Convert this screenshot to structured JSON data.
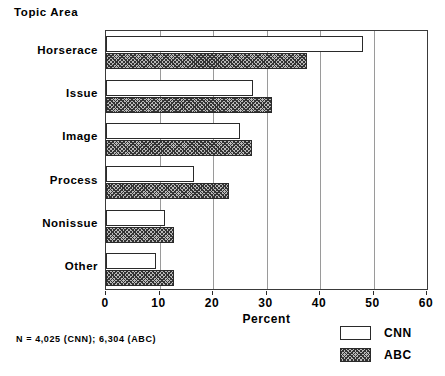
{
  "chart_data": {
    "type": "bar",
    "orientation": "horizontal",
    "title": "Topic Area",
    "xlabel": "Percent",
    "ylabel": "",
    "xlim": [
      0,
      60
    ],
    "xticks": [
      0,
      10,
      20,
      30,
      40,
      50,
      60
    ],
    "xtick_labels": [
      "0",
      "10",
      "20",
      "30",
      "40",
      "50",
      "60"
    ],
    "grid": true,
    "grid_axis": "x",
    "legend_position": "bottom-right",
    "categories": [
      "Horserace",
      "Issue",
      "Image",
      "Process",
      "Nonissue",
      "Other"
    ],
    "series": [
      {
        "name": "CNN",
        "color": "#ffffff",
        "pattern": "solid-white",
        "values": [
          48,
          27.5,
          25,
          16.5,
          11,
          9.3
        ]
      },
      {
        "name": "ABC",
        "color": "#b9b9b9",
        "pattern": "cross-hatch",
        "values": [
          37.5,
          31,
          27.3,
          23,
          12.8,
          12.8
        ]
      }
    ],
    "footnote": "N = 4,025 (CNN); 6,304 (ABC)"
  },
  "legend": {
    "entries": [
      {
        "label": "CNN",
        "swatch": "cnn"
      },
      {
        "label": "ABC",
        "swatch": "abc"
      }
    ]
  }
}
